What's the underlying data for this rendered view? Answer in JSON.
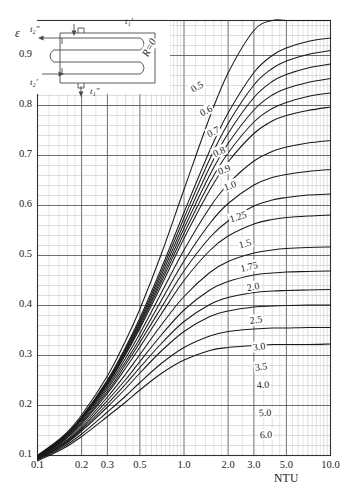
{
  "chart_data": {
    "type": "line",
    "title": "",
    "xlabel": "NTU",
    "ylabel": "ε",
    "xscale": "log",
    "yscale": "linear",
    "xlim": [
      0.1,
      10.0
    ],
    "ylim": [
      0.1,
      0.97
    ],
    "grid": true,
    "legend_position": "inline-right-curve-labels",
    "xtick_labels": [
      "0.1",
      "0.2",
      "0.3",
      "0.5",
      "1.0",
      "2.0",
      "3.0",
      "5.0",
      "10.0"
    ],
    "xtick_values": [
      0.1,
      0.2,
      0.3,
      0.5,
      1.0,
      2.0,
      3.0,
      5.0,
      10.0
    ],
    "ytick_labels": [
      "0.1",
      "0.2",
      "0.3",
      "0.4",
      "0.5",
      "0.6",
      "0.7",
      "0.8",
      "0.9"
    ],
    "ytick_values": [
      0.1,
      0.2,
      0.3,
      0.4,
      0.5,
      0.6,
      0.7,
      0.8,
      0.9
    ],
    "series_parameter": "R",
    "x": [
      0.1,
      0.15,
      0.2,
      0.3,
      0.4,
      0.5,
      0.7,
      1.0,
      1.5,
      2.0,
      3.0,
      4.0,
      5.0,
      7.0,
      10.0
    ],
    "series": [
      {
        "name": "R=0",
        "label": "R=0",
        "values": [
          0.1,
          0.139,
          0.181,
          0.259,
          0.33,
          0.393,
          0.503,
          0.632,
          0.777,
          0.865,
          0.95,
          0.975,
          0.979,
          0.981,
          0.982
        ]
      },
      {
        "name": "0.5",
        "label": "0.5",
        "values": [
          0.099,
          0.137,
          0.177,
          0.251,
          0.317,
          0.375,
          0.474,
          0.586,
          0.71,
          0.785,
          0.866,
          0.9,
          0.915,
          0.928,
          0.935
        ]
      },
      {
        "name": "0.6",
        "label": "0.6",
        "values": [
          0.099,
          0.136,
          0.176,
          0.249,
          0.314,
          0.37,
          0.467,
          0.575,
          0.693,
          0.764,
          0.841,
          0.874,
          0.889,
          0.902,
          0.91
        ]
      },
      {
        "name": "0.7",
        "label": "0.7",
        "values": [
          0.099,
          0.136,
          0.175,
          0.247,
          0.311,
          0.366,
          0.46,
          0.564,
          0.677,
          0.744,
          0.816,
          0.848,
          0.862,
          0.875,
          0.883
        ]
      },
      {
        "name": "0.8",
        "label": "0.8",
        "values": [
          0.098,
          0.135,
          0.174,
          0.245,
          0.308,
          0.362,
          0.453,
          0.554,
          0.661,
          0.724,
          0.791,
          0.821,
          0.834,
          0.846,
          0.854
        ]
      },
      {
        "name": "0.9",
        "label": "0.9",
        "values": [
          0.098,
          0.135,
          0.173,
          0.243,
          0.305,
          0.358,
          0.447,
          0.544,
          0.646,
          0.705,
          0.767,
          0.794,
          0.806,
          0.818,
          0.825
        ]
      },
      {
        "name": "1.0",
        "label": "1.0",
        "values": [
          0.098,
          0.134,
          0.172,
          0.241,
          0.302,
          0.354,
          0.44,
          0.534,
          0.631,
          0.687,
          0.744,
          0.769,
          0.78,
          0.79,
          0.797
        ]
      },
      {
        "name": "1.25",
        "label": "1.25",
        "values": [
          0.097,
          0.133,
          0.17,
          0.237,
          0.295,
          0.344,
          0.425,
          0.511,
          0.596,
          0.643,
          0.689,
          0.708,
          0.717,
          0.725,
          0.73
        ]
      },
      {
        "name": "1.5",
        "label": "1.5",
        "values": [
          0.097,
          0.131,
          0.167,
          0.233,
          0.288,
          0.334,
          0.41,
          0.489,
          0.564,
          0.604,
          0.641,
          0.656,
          0.662,
          0.668,
          0.672
        ]
      },
      {
        "name": "1.75",
        "label": "1.75",
        "values": [
          0.096,
          0.13,
          0.165,
          0.228,
          0.282,
          0.326,
          0.396,
          0.469,
          0.536,
          0.569,
          0.599,
          0.611,
          0.616,
          0.621,
          0.623
        ]
      },
      {
        "name": "2.0",
        "label": "2.0",
        "values": [
          0.096,
          0.129,
          0.163,
          0.224,
          0.275,
          0.317,
          0.383,
          0.45,
          0.51,
          0.539,
          0.563,
          0.572,
          0.576,
          0.579,
          0.581
        ]
      },
      {
        "name": "2.5",
        "label": "2.5",
        "values": [
          0.095,
          0.126,
          0.159,
          0.217,
          0.263,
          0.302,
          0.361,
          0.418,
          0.466,
          0.488,
          0.505,
          0.511,
          0.514,
          0.516,
          0.517
        ]
      },
      {
        "name": "3.0",
        "label": "3.0",
        "values": [
          0.094,
          0.124,
          0.155,
          0.21,
          0.252,
          0.288,
          0.341,
          0.391,
          0.431,
          0.448,
          0.461,
          0.465,
          0.467,
          0.468,
          0.469
        ]
      },
      {
        "name": "3.5",
        "label": "3.5",
        "values": [
          0.093,
          0.122,
          0.152,
          0.203,
          0.243,
          0.276,
          0.324,
          0.368,
          0.402,
          0.416,
          0.426,
          0.429,
          0.43,
          0.431,
          0.432
        ]
      },
      {
        "name": "4.0",
        "label": "4.0",
        "values": [
          0.092,
          0.12,
          0.149,
          0.197,
          0.234,
          0.265,
          0.309,
          0.348,
          0.378,
          0.389,
          0.397,
          0.399,
          0.4,
          0.401,
          0.401
        ]
      },
      {
        "name": "5.0",
        "label": "5.0",
        "values": [
          0.091,
          0.117,
          0.143,
          0.187,
          0.219,
          0.246,
          0.284,
          0.316,
          0.339,
          0.348,
          0.353,
          0.355,
          0.355,
          0.356,
          0.356
        ]
      },
      {
        "name": "6.0",
        "label": "6.0",
        "values": [
          0.089,
          0.114,
          0.138,
          0.178,
          0.207,
          0.231,
          0.264,
          0.291,
          0.31,
          0.316,
          0.32,
          0.322,
          0.322,
          0.322,
          0.323
        ]
      }
    ],
    "annotations": [
      {
        "text": "R=0",
        "kind": "curve-label",
        "rotated": true
      },
      {
        "text": "0.9",
        "kind": "ytick-inside-inset-gap"
      }
    ]
  },
  "axes": {
    "y_axis_symbol": "ε",
    "x_axis_title": "NTU",
    "y_ticks": [
      {
        "label": "0.9",
        "value": 0.9
      },
      {
        "label": "0.8",
        "value": 0.8
      },
      {
        "label": "0.7",
        "value": 0.7
      },
      {
        "label": "0.6",
        "value": 0.6
      },
      {
        "label": "0.5",
        "value": 0.5
      },
      {
        "label": "0.4",
        "value": 0.4
      },
      {
        "label": "0.3",
        "value": 0.3
      },
      {
        "label": "0.2",
        "value": 0.2
      },
      {
        "label": "0.1",
        "value": 0.1
      }
    ],
    "x_ticks": [
      {
        "label": "0.1",
        "value": 0.1
      },
      {
        "label": "0.2",
        "value": 0.2
      },
      {
        "label": "0.3",
        "value": 0.3
      },
      {
        "label": "0.5",
        "value": 0.5
      },
      {
        "label": "1.0",
        "value": 1.0
      },
      {
        "label": "2.0",
        "value": 2.0
      },
      {
        "label": "3.0",
        "value": 3.0
      },
      {
        "label": "5.0",
        "value": 5.0
      },
      {
        "label": "10.0",
        "value": 10.0
      }
    ]
  },
  "curve_labels": [
    {
      "text": "R=0",
      "x": 0.58,
      "y": 0.915,
      "rot": -62
    },
    {
      "text": "0.5",
      "x": 1.22,
      "y": 0.838,
      "rot": -30
    },
    {
      "text": "0.6",
      "x": 1.42,
      "y": 0.79,
      "rot": -28
    },
    {
      "text": "0.7",
      "x": 1.58,
      "y": 0.748,
      "rot": -26
    },
    {
      "text": "0.8",
      "x": 1.72,
      "y": 0.708,
      "rot": -24
    },
    {
      "text": "0.9",
      "x": 1.88,
      "y": 0.672,
      "rot": -22
    },
    {
      "text": "1.0",
      "x": 2.05,
      "y": 0.64,
      "rot": -20
    },
    {
      "text": "1.25",
      "x": 2.35,
      "y": 0.578,
      "rot": -17
    },
    {
      "text": "1.5",
      "x": 2.6,
      "y": 0.524,
      "rot": -15
    },
    {
      "text": "1.75",
      "x": 2.78,
      "y": 0.478,
      "rot": -13
    },
    {
      "text": "2.0",
      "x": 2.95,
      "y": 0.438,
      "rot": -11
    },
    {
      "text": "2.5",
      "x": 3.1,
      "y": 0.372,
      "rot": -9
    },
    {
      "text": "3.0",
      "x": 3.25,
      "y": 0.318,
      "rot": -7
    },
    {
      "text": "3.5",
      "x": 3.35,
      "y": 0.277,
      "rot": -6
    },
    {
      "text": "4.0",
      "x": 3.45,
      "y": 0.242,
      "rot": -5
    },
    {
      "text": "5.0",
      "x": 3.55,
      "y": 0.185,
      "rot": -3
    },
    {
      "text": "6.0",
      "x": 3.62,
      "y": 0.142,
      "rot": -2
    }
  ],
  "inset": {
    "name": "heat-exchanger-schematic",
    "description": "Four-pass serpentine heat exchanger flow arrangement",
    "labels": [
      {
        "id": "t1-prime",
        "text": "t₁′"
      },
      {
        "id": "t1-double-prime",
        "text": "t₁″"
      },
      {
        "id": "t2-prime",
        "text": "t₂′"
      },
      {
        "id": "t2-double-prime",
        "text": "t₂″"
      }
    ]
  },
  "colors": {
    "curve": "#1a1a1a",
    "major_grid": "#555555",
    "minor_grid": "#bbbbbb",
    "frame": "#333333",
    "background": "#ffffff",
    "inset_line": "#4a4a4a"
  }
}
